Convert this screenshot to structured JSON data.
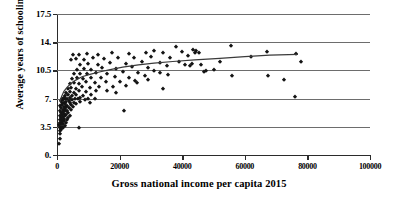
{
  "chart_data": {
    "type": "scatter",
    "title": "",
    "xlabel": "Gross national income per capita 2015",
    "ylabel": "Average years of schooling",
    "xlim": [
      0,
      100000
    ],
    "ylim": [
      0,
      17.5
    ],
    "grid": true,
    "legend": null,
    "xticks": [
      0,
      20000,
      40000,
      60000,
      80000,
      100000
    ],
    "xtick_labels": [
      "0",
      "20000",
      "40000",
      "60000",
      "80000",
      "100000"
    ],
    "yticks": [
      0,
      3.5,
      7,
      10.5,
      14,
      17.5
    ],
    "ytick_labels": [
      "0.",
      "3.5",
      "7.",
      "10.5",
      "14.",
      "17.5"
    ],
    "marker": "diamond",
    "marker_color": "#141414",
    "trendline": {
      "type": "logarithmic",
      "color": "#3a3a3a",
      "x_start": 900,
      "x_end": 77000,
      "points": [
        [
          900,
          6.6
        ],
        [
          1500,
          7.3
        ],
        [
          2200,
          7.9
        ],
        [
          3200,
          8.4
        ],
        [
          4500,
          8.9
        ],
        [
          6000,
          9.3
        ],
        [
          8000,
          9.7
        ],
        [
          10500,
          10.0
        ],
        [
          13500,
          10.3
        ],
        [
          17000,
          10.6
        ],
        [
          21000,
          10.9
        ],
        [
          26000,
          11.2
        ],
        [
          31000,
          11.4
        ],
        [
          37000,
          11.6
        ],
        [
          44000,
          11.8
        ],
        [
          52000,
          12.0
        ],
        [
          60000,
          12.2
        ],
        [
          68000,
          12.4
        ],
        [
          77000,
          12.5
        ]
      ]
    },
    "points": [
      [
        700,
        1.4
      ],
      [
        900,
        2.0
      ],
      [
        1000,
        2.6
      ],
      [
        800,
        3.0
      ],
      [
        1200,
        3.1
      ],
      [
        1400,
        3.3
      ],
      [
        900,
        3.4
      ],
      [
        1100,
        3.5
      ],
      [
        1600,
        3.5
      ],
      [
        2000,
        3.4
      ],
      [
        700,
        3.7
      ],
      [
        1300,
        3.8
      ],
      [
        1800,
        3.9
      ],
      [
        2400,
        3.6
      ],
      [
        1000,
        4.0
      ],
      [
        1500,
        4.1
      ],
      [
        2100,
        4.2
      ],
      [
        2800,
        4.0
      ],
      [
        900,
        4.3
      ],
      [
        1700,
        4.4
      ],
      [
        2300,
        4.5
      ],
      [
        3100,
        4.3
      ],
      [
        1200,
        4.6
      ],
      [
        1900,
        4.7
      ],
      [
        2600,
        4.8
      ],
      [
        3500,
        4.6
      ],
      [
        1100,
        4.9
      ],
      [
        1600,
        5.0
      ],
      [
        2200,
        5.1
      ],
      [
        3000,
        5.0
      ],
      [
        4200,
        4.9
      ],
      [
        1400,
        5.2
      ],
      [
        2000,
        5.3
      ],
      [
        2700,
        5.4
      ],
      [
        3600,
        5.2
      ],
      [
        900,
        5.5
      ],
      [
        1800,
        5.6
      ],
      [
        2500,
        5.7
      ],
      [
        3300,
        5.5
      ],
      [
        4500,
        5.6
      ],
      [
        1300,
        5.8
      ],
      [
        2100,
        5.9
      ],
      [
        2900,
        6.0
      ],
      [
        3900,
        5.8
      ],
      [
        5200,
        5.9
      ],
      [
        1000,
        6.1
      ],
      [
        1700,
        6.2
      ],
      [
        2400,
        6.3
      ],
      [
        3200,
        6.1
      ],
      [
        4400,
        6.2
      ],
      [
        6000,
        6.3
      ],
      [
        1500,
        6.4
      ],
      [
        2200,
        6.5
      ],
      [
        3000,
        6.6
      ],
      [
        4000,
        6.4
      ],
      [
        5400,
        6.5
      ],
      [
        7200,
        6.6
      ],
      [
        1200,
        6.7
      ],
      [
        1900,
        6.8
      ],
      [
        2700,
        6.9
      ],
      [
        3700,
        6.7
      ],
      [
        4900,
        6.8
      ],
      [
        6600,
        6.9
      ],
      [
        8800,
        6.8
      ],
      [
        1600,
        7.0
      ],
      [
        2300,
        7.1
      ],
      [
        3100,
        7.0
      ],
      [
        4200,
        7.1
      ],
      [
        5600,
        7.0
      ],
      [
        7500,
        7.1
      ],
      [
        10000,
        7.0
      ],
      [
        2600,
        7.3
      ],
      [
        3500,
        7.4
      ],
      [
        4700,
        7.3
      ],
      [
        6200,
        7.4
      ],
      [
        8200,
        7.3
      ],
      [
        11000,
        7.5
      ],
      [
        3000,
        7.7
      ],
      [
        4000,
        7.8
      ],
      [
        5400,
        7.7
      ],
      [
        7000,
        7.9
      ],
      [
        9400,
        7.8
      ],
      [
        12500,
        8.0
      ],
      [
        16000,
        7.9
      ],
      [
        3400,
        8.2
      ],
      [
        4600,
        8.3
      ],
      [
        6000,
        8.2
      ],
      [
        8000,
        8.4
      ],
      [
        10500,
        8.3
      ],
      [
        13500,
        8.5
      ],
      [
        18000,
        8.4
      ],
      [
        22000,
        8.6
      ],
      [
        4000,
        8.8
      ],
      [
        5300,
        8.9
      ],
      [
        7000,
        8.8
      ],
      [
        9200,
        9.0
      ],
      [
        12000,
        8.9
      ],
      [
        15500,
        9.1
      ],
      [
        20000,
        9.0
      ],
      [
        25000,
        9.2
      ],
      [
        4800,
        9.4
      ],
      [
        6300,
        9.5
      ],
      [
        8300,
        9.4
      ],
      [
        11000,
        9.6
      ],
      [
        14000,
        9.5
      ],
      [
        18500,
        9.7
      ],
      [
        23000,
        9.6
      ],
      [
        28000,
        9.8
      ],
      [
        5500,
        10.0
      ],
      [
        7200,
        10.1
      ],
      [
        9500,
        10.0
      ],
      [
        12500,
        10.2
      ],
      [
        16000,
        10.1
      ],
      [
        21000,
        10.3
      ],
      [
        26000,
        10.2
      ],
      [
        31000,
        10.4
      ],
      [
        6500,
        10.6
      ],
      [
        8500,
        10.7
      ],
      [
        11000,
        10.6
      ],
      [
        14500,
        10.8
      ],
      [
        19000,
        10.7
      ],
      [
        24000,
        10.9
      ],
      [
        29000,
        10.8
      ],
      [
        35000,
        11.0
      ],
      [
        7500,
        11.2
      ],
      [
        10000,
        11.3
      ],
      [
        13000,
        11.2
      ],
      [
        17000,
        11.4
      ],
      [
        22000,
        11.3
      ],
      [
        27000,
        11.5
      ],
      [
        33000,
        11.4
      ],
      [
        39000,
        11.6
      ],
      [
        4500,
        11.8
      ],
      [
        6000,
        11.9
      ],
      [
        8500,
        11.8
      ],
      [
        11500,
        12.0
      ],
      [
        15000,
        11.9
      ],
      [
        19500,
        12.1
      ],
      [
        24500,
        12.0
      ],
      [
        30000,
        12.2
      ],
      [
        36000,
        12.1
      ],
      [
        42000,
        12.3
      ],
      [
        5000,
        12.4
      ],
      [
        7000,
        12.4
      ],
      [
        9500,
        12.5
      ],
      [
        13000,
        12.4
      ],
      [
        17500,
        12.6
      ],
      [
        23000,
        12.5
      ],
      [
        28500,
        12.7
      ],
      [
        34000,
        12.6
      ],
      [
        40000,
        12.8
      ],
      [
        44000,
        12.7
      ],
      [
        43500,
        13.0
      ],
      [
        44500,
        12.9
      ],
      [
        45500,
        12.6
      ],
      [
        38000,
        13.4
      ],
      [
        31000,
        12.9
      ],
      [
        41000,
        11.2
      ],
      [
        42500,
        11.1
      ],
      [
        43000,
        11.3
      ],
      [
        46000,
        11.2
      ],
      [
        47500,
        10.4
      ],
      [
        52000,
        11.5
      ],
      [
        55500,
        13.5
      ],
      [
        56000,
        9.8
      ],
      [
        62000,
        12.2
      ],
      [
        67000,
        12.8
      ],
      [
        67500,
        9.8
      ],
      [
        72500,
        9.3
      ],
      [
        76000,
        7.2
      ],
      [
        76500,
        12.5
      ],
      [
        78000,
        11.6
      ],
      [
        33000,
        10.2
      ],
      [
        34000,
        8.2
      ],
      [
        35500,
        9.9
      ],
      [
        21500,
        5.5
      ],
      [
        7000,
        3.4
      ],
      [
        10500,
        6.4
      ],
      [
        12000,
        6.9
      ],
      [
        19000,
        7.7
      ],
      [
        25500,
        8.9
      ],
      [
        29000,
        9.3
      ],
      [
        47000,
        10.3
      ],
      [
        50000,
        10.5
      ]
    ]
  }
}
